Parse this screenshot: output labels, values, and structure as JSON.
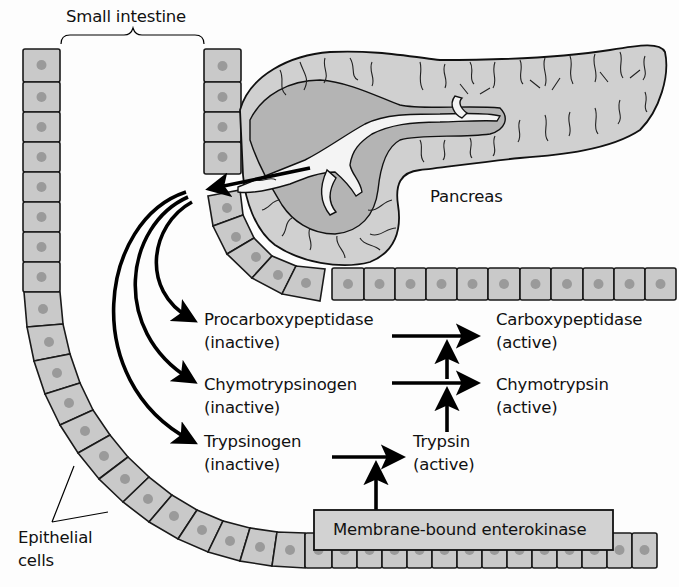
{
  "figure": {
    "labels": {
      "small_intestine": "Small intestine",
      "pancreas": "Pancreas",
      "epithelial_line1": "Epithelial",
      "epithelial_line2": "cells",
      "enterokinase": "Membrane-bound enterokinase"
    },
    "zymogens": [
      {
        "name": "Procarboxypeptidase",
        "state": "(inactive)"
      },
      {
        "name": "Chymotrypsinogen",
        "state": "(inactive)"
      },
      {
        "name": "Trypsinogen",
        "state": "(inactive)"
      }
    ],
    "active_enzymes": [
      {
        "name": "Carboxypeptidase",
        "state": "(active)"
      },
      {
        "name": "Chymotrypsin",
        "state": "(active)"
      },
      {
        "name": "Trypsin",
        "state": "(active)"
      }
    ],
    "pathway": [
      {
        "from": "Procarboxypeptidase",
        "to": "Carboxypeptidase",
        "activated_by": "Trypsin"
      },
      {
        "from": "Chymotrypsinogen",
        "to": "Chymotrypsin",
        "activated_by": "Trypsin"
      },
      {
        "from": "Trypsinogen",
        "to": "Trypsin",
        "activated_by": "Membrane-bound enterokinase"
      }
    ],
    "colors": {
      "cell_fill": "#c9c9c9",
      "nucleus": "#9a9a9a",
      "pancreas_fill": "#d0d0d0",
      "outline": "#111111",
      "background": "#fdfdfd"
    }
  }
}
